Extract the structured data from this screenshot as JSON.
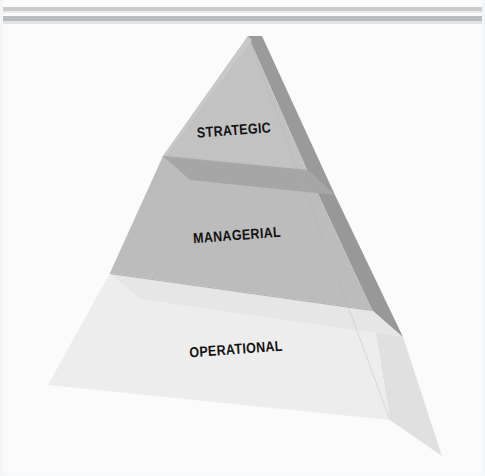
{
  "figure": {
    "kind": "pyramid-diagram",
    "orientation": "vertical-3d",
    "background_color": "#fbfbfc",
    "frame_color": "#f4f5f6",
    "top_rules": [
      {
        "name": "rule-upper",
        "color": "#c9cbcd",
        "shadow_color": "#e9eaeb"
      },
      {
        "name": "rule-lower",
        "color": "#babcbf",
        "shadow_color": "#e2e3e5"
      }
    ],
    "apex": {
      "x": 248,
      "y": 36
    },
    "base_left": {
      "x": 48,
      "y": 385
    },
    "base_right_front": {
      "x": 390,
      "y": 420
    },
    "base_right_back": {
      "x": 442,
      "y": 456
    },
    "label_rotation_deg": -4.2
  },
  "levels": [
    {
      "id": "strategic",
      "label": "STRATEGIC",
      "tier": 1,
      "position": "top",
      "front_color": "#c2c2c2",
      "side_color": "#9a9a9a",
      "edge_color": "#a9a9a9",
      "label_color": "#131313"
    },
    {
      "id": "managerial",
      "label": "MANAGERIAL",
      "tier": 2,
      "position": "middle",
      "front_color": "#bcbcbc",
      "side_color": "#989898",
      "edge_color": "#a6a6a6",
      "label_color": "#131313"
    },
    {
      "id": "operational",
      "label": "OPERATIONAL",
      "tier": 3,
      "position": "bottom",
      "front_color": "#ededed",
      "side_color": "#e0e0e0",
      "edge_color": "#e6e6e6",
      "label_color": "#131313"
    }
  ]
}
